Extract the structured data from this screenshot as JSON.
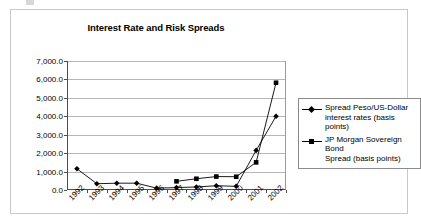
{
  "chart_data": {
    "type": "line",
    "title": "Interest Rate and Risk Spreads",
    "xlabel": "",
    "ylabel": "",
    "categories": [
      "1992",
      "1993",
      "1994",
      "1995",
      "1996",
      "1997",
      "1998",
      "1999",
      "2000",
      "2001",
      "2002"
    ],
    "ylim": [
      0,
      7000
    ],
    "ytick_step": 1000,
    "ytick_labels": [
      "0.0",
      "1,000.0",
      "2,000.0",
      "3,000.0",
      "4,000.0",
      "5,000.0",
      "6,000.0",
      "7,000.0"
    ],
    "ytick_values": [
      0,
      1000,
      2000,
      3000,
      4000,
      5000,
      6000,
      7000
    ],
    "grid": "horizontal",
    "legend_position": "right",
    "series": [
      {
        "name": "Spread Peso/US-Dollar interest rates (basis points)",
        "marker": "diamond",
        "color": "#000000",
        "values": [
          1150,
          340,
          370,
          370,
          100,
          130,
          165,
          230,
          200,
          2150,
          4000
        ]
      },
      {
        "name": "JP Morgan Sovereign Bond Spread (basis points)",
        "marker": "square",
        "color": "#000000",
        "values": [
          null,
          null,
          null,
          null,
          null,
          470,
          610,
          730,
          720,
          1500,
          5820
        ]
      }
    ]
  },
  "legend": {
    "entries": [
      {
        "line1": "Spread Peso/US-Dollar",
        "line2": "interest rates (basis points)",
        "marker": "diamond"
      },
      {
        "line1": "JP Morgan Sovereign Bond",
        "line2": "Spread (basis points)",
        "marker": "square"
      }
    ]
  }
}
